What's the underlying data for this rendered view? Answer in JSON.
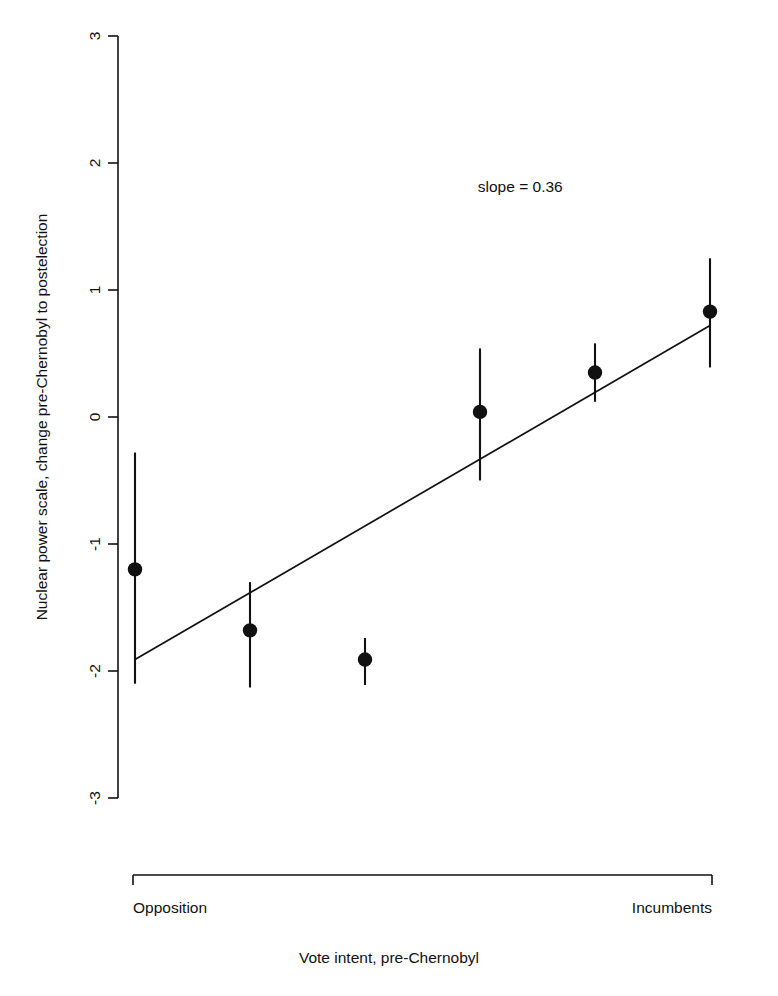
{
  "chart_data": {
    "type": "scatter",
    "title": "",
    "xlabel": "Vote intent, pre-Chernobyl",
    "ylabel": "Nuclear power scale, change pre-Chernobyl to postelection",
    "ylim": [
      -3,
      3
    ],
    "xlim": [
      0,
      7
    ],
    "grid": false,
    "legend": null,
    "yticks": [
      3,
      2,
      1,
      0,
      -1,
      -2,
      -3
    ],
    "ytick_labels": [
      "3",
      "2",
      "1",
      "0",
      "-1",
      "-2",
      "-3"
    ],
    "xtick_labels": [
      "Opposition",
      "Incumbents"
    ],
    "x_axis_left_label": "Opposition",
    "x_axis_right_label": "Incumbents",
    "annotations": [
      {
        "text": "slope = 0.36",
        "x": 4.35,
        "y": 1.77
      }
    ],
    "slope": 0.36,
    "series": [
      {
        "name": "Nuclear power scale change by vote intent",
        "marker": "filled-circle",
        "error": "vertical-bars",
        "points": [
          {
            "x": 1,
            "y": -1.2,
            "ylow": -2.1,
            "yhigh": -0.28,
            "label": "Opposition"
          },
          {
            "x": 2,
            "y": -1.68,
            "ylow": -2.13,
            "yhigh": -1.3,
            "label": ""
          },
          {
            "x": 3,
            "y": -1.91,
            "ylow": -2.11,
            "yhigh": -1.74,
            "label": ""
          },
          {
            "x": 4,
            "y": 0.04,
            "ylow": -0.5,
            "yhigh": 0.54,
            "label": ""
          },
          {
            "x": 5,
            "y": 0.35,
            "ylow": 0.12,
            "yhigh": 0.58,
            "label": ""
          },
          {
            "x": 6,
            "y": 0.83,
            "ylow": 0.39,
            "yhigh": 1.25,
            "label": "Incumbents"
          }
        ]
      }
    ],
    "fit_line": {
      "x0": 1,
      "y0": -1.91,
      "x1": 6,
      "y1": 0.72
    }
  },
  "axes": {
    "y_label_text": "Nuclear power scale, change pre-Chernobyl to postelection",
    "x_label_text": "Vote intent, pre-Chernobyl",
    "y_tick_3": "3",
    "y_tick_2": "2",
    "y_tick_1": "1",
    "y_tick_0": "0",
    "y_tick_m1": "-1",
    "y_tick_m2": "-2",
    "y_tick_m3": "-3",
    "x_left": "Opposition",
    "x_right": "Incumbents"
  },
  "annotation": {
    "slope_text": "slope = 0.36"
  }
}
